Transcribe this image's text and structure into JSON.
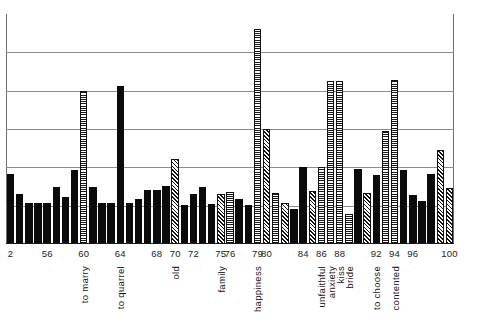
{
  "chart_data": {
    "type": "bar",
    "title": "",
    "subtitle": "",
    "xlabel": "",
    "ylabel": "",
    "grid": true,
    "legend_position": "none",
    "xlim": [
      52,
      101
    ],
    "ylim": [
      0,
      6
    ],
    "y_gridlines": [
      1,
      2,
      3,
      4,
      5
    ],
    "x_tick_labels": [
      {
        "value": 52,
        "label": "2"
      },
      {
        "value": 56,
        "label": "56"
      },
      {
        "value": 60,
        "label": "60"
      },
      {
        "value": 64,
        "label": "64"
      },
      {
        "value": 68,
        "label": "68"
      },
      {
        "value": 70,
        "label": "70"
      },
      {
        "value": 72,
        "label": "72"
      },
      {
        "value": 75,
        "label": "75"
      },
      {
        "value": 76,
        "label": "76"
      },
      {
        "value": 79,
        "label": "79"
      },
      {
        "value": 80,
        "label": "80"
      },
      {
        "value": 84,
        "label": "84"
      },
      {
        "value": 86,
        "label": "86"
      },
      {
        "value": 88,
        "label": "88"
      },
      {
        "value": 92,
        "label": "92"
      },
      {
        "value": 94,
        "label": "94"
      },
      {
        "value": 96,
        "label": "96"
      },
      {
        "value": 100,
        "label": "100"
      }
    ],
    "category_annotations": [
      {
        "value": 60,
        "label": "to marry"
      },
      {
        "value": 64,
        "label": "to quarrel"
      },
      {
        "value": 70,
        "label": "old"
      },
      {
        "value": 75,
        "label": "family"
      },
      {
        "value": 79,
        "label": "happiness"
      },
      {
        "value": 86,
        "label": "unfaithful"
      },
      {
        "value": 87,
        "label": "anxiety"
      },
      {
        "value": 88,
        "label": "kiss"
      },
      {
        "value": 89,
        "label": "bride"
      },
      {
        "value": 92,
        "label": "to choose"
      },
      {
        "value": 94,
        "label": "contented"
      }
    ],
    "patterns": {
      "solid": "solid-black",
      "hatch": "diagonal-hatch",
      "dots": "stippled-dots"
    },
    "bars": [
      {
        "x": 52,
        "value": 1.82,
        "pattern": "solid"
      },
      {
        "x": 53,
        "value": 1.3,
        "pattern": "solid"
      },
      {
        "x": 54,
        "value": 1.08,
        "pattern": "solid"
      },
      {
        "x": 55,
        "value": 1.08,
        "pattern": "solid"
      },
      {
        "x": 56,
        "value": 1.08,
        "pattern": "solid"
      },
      {
        "x": 57,
        "value": 1.48,
        "pattern": "solid"
      },
      {
        "x": 58,
        "value": 1.22,
        "pattern": "solid"
      },
      {
        "x": 59,
        "value": 1.92,
        "pattern": "solid"
      },
      {
        "x": 60,
        "value": 4.0,
        "pattern": "dots"
      },
      {
        "x": 61,
        "value": 1.48,
        "pattern": "solid"
      },
      {
        "x": 62,
        "value": 1.08,
        "pattern": "solid"
      },
      {
        "x": 63,
        "value": 1.08,
        "pattern": "solid"
      },
      {
        "x": 64,
        "value": 4.12,
        "pattern": "solid"
      },
      {
        "x": 65,
        "value": 1.08,
        "pattern": "solid"
      },
      {
        "x": 66,
        "value": 1.18,
        "pattern": "solid"
      },
      {
        "x": 67,
        "value": 1.42,
        "pattern": "solid"
      },
      {
        "x": 68,
        "value": 1.42,
        "pattern": "solid"
      },
      {
        "x": 69,
        "value": 1.52,
        "pattern": "solid"
      },
      {
        "x": 70,
        "value": 2.22,
        "pattern": "hatch"
      },
      {
        "x": 71,
        "value": 1.02,
        "pattern": "solid"
      },
      {
        "x": 72,
        "value": 1.3,
        "pattern": "solid"
      },
      {
        "x": 73,
        "value": 1.48,
        "pattern": "solid"
      },
      {
        "x": 74,
        "value": 1.05,
        "pattern": "solid"
      },
      {
        "x": 75,
        "value": 1.3,
        "pattern": "hatch"
      },
      {
        "x": 76,
        "value": 1.35,
        "pattern": "dots"
      },
      {
        "x": 77,
        "value": 1.18,
        "pattern": "solid"
      },
      {
        "x": 78,
        "value": 1.02,
        "pattern": "solid"
      },
      {
        "x": 79,
        "value": 5.62,
        "pattern": "dots"
      },
      {
        "x": 80,
        "value": 3.0,
        "pattern": "hatch"
      },
      {
        "x": 81,
        "value": 1.32,
        "pattern": "dots"
      },
      {
        "x": 82,
        "value": 1.08,
        "pattern": "hatch"
      },
      {
        "x": 83,
        "value": 0.92,
        "pattern": "solid"
      },
      {
        "x": 84,
        "value": 2.0,
        "pattern": "solid"
      },
      {
        "x": 85,
        "value": 1.38,
        "pattern": "hatch"
      },
      {
        "x": 86,
        "value": 2.0,
        "pattern": "dots"
      },
      {
        "x": 87,
        "value": 4.25,
        "pattern": "dots"
      },
      {
        "x": 88,
        "value": 4.25,
        "pattern": "dots"
      },
      {
        "x": 89,
        "value": 0.78,
        "pattern": "dots"
      },
      {
        "x": 90,
        "value": 1.95,
        "pattern": "solid"
      },
      {
        "x": 91,
        "value": 1.32,
        "pattern": "hatch"
      },
      {
        "x": 92,
        "value": 1.8,
        "pattern": "solid"
      },
      {
        "x": 93,
        "value": 2.95,
        "pattern": "dots"
      },
      {
        "x": 94,
        "value": 4.28,
        "pattern": "dots"
      },
      {
        "x": 95,
        "value": 1.92,
        "pattern": "solid"
      },
      {
        "x": 96,
        "value": 1.28,
        "pattern": "solid"
      },
      {
        "x": 97,
        "value": 1.12,
        "pattern": "solid"
      },
      {
        "x": 98,
        "value": 1.82,
        "pattern": "solid"
      },
      {
        "x": 99,
        "value": 2.45,
        "pattern": "hatch"
      },
      {
        "x": 100,
        "value": 1.45,
        "pattern": "hatch"
      }
    ]
  },
  "colors": {
    "bar_solid": "#0b0b0b",
    "gridline": "#8d8d8d",
    "axis": "#1a1a1a",
    "background": "#ffffff",
    "text": "#1b1b1b"
  }
}
